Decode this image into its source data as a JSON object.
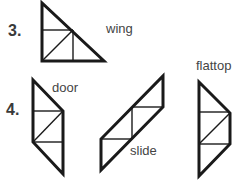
{
  "items": [
    {
      "number": "3.",
      "labels": [
        "wing"
      ]
    },
    {
      "number": "4.",
      "labels": [
        "door",
        "slide",
        "flattop"
      ]
    }
  ],
  "shapes": {
    "wing": {
      "label": "wing"
    },
    "door": {
      "label": "door"
    },
    "slide": {
      "label": "slide"
    },
    "flattop": {
      "label": "flattop"
    }
  },
  "colors": {
    "stroke": "#1a1a1a",
    "text": "#444444",
    "background": "#ffffff"
  }
}
